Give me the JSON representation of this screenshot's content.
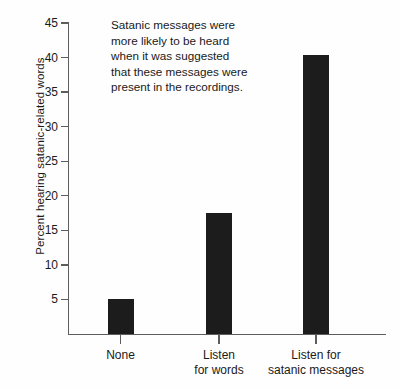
{
  "chart_data": {
    "type": "bar",
    "title": "",
    "subtitle": "",
    "xlabel": "",
    "ylabel": "Percent hearing satanic-related words",
    "categories": [
      "None",
      "Listen\nfor words",
      "Listen for\nsatanic messages"
    ],
    "values": [
      5.0,
      17.5,
      40.3
    ],
    "series": [
      {
        "name": "Percent hearing satanic-related words",
        "values": [
          5.0,
          17.5,
          40.3
        ]
      }
    ],
    "ylim": [
      0,
      45
    ],
    "ytick_values": [
      5,
      10,
      15,
      20,
      25,
      30,
      35,
      40,
      45
    ],
    "ytick_labels": [
      "5",
      "10",
      "15",
      "20",
      "25",
      "30",
      "35",
      "40",
      "45"
    ],
    "grid": false,
    "legend": false,
    "legend_position": "none",
    "bar_color": "#1c1c1c",
    "axis_color": "#5d5d5d",
    "background_color": "#fefefe",
    "annotations": [
      {
        "text": "Satanic messages were\nmore likely to be heard\nwhen it was suggested\nthat these messages were\npresent in the recordings.",
        "x_units": 0.5,
        "y_units": 44
      }
    ]
  },
  "figure": {
    "annotation_text": "Satanic messages were\nmore likely to be heard\nwhen it was suggested\nthat these messages were\npresent in the recordings."
  }
}
